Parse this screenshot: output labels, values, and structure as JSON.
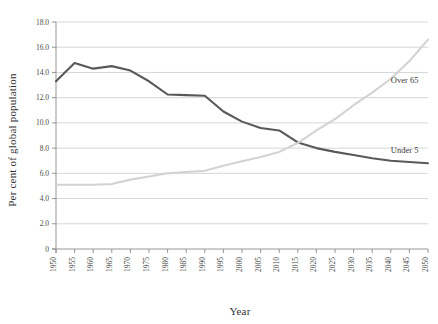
{
  "chart_data": {
    "type": "line",
    "title": "",
    "xlabel": "Year",
    "ylabel": "Per cent of global population",
    "x": [
      1950,
      1955,
      1960,
      1965,
      1970,
      1975,
      1980,
      1985,
      1990,
      1995,
      2000,
      2005,
      2010,
      2015,
      2020,
      2025,
      2030,
      2035,
      2040,
      2045,
      2050
    ],
    "xtick_labels": [
      "1950",
      "1955",
      "1960",
      "1965",
      "1970",
      "1975",
      "1980",
      "1985",
      "1990",
      "1995",
      "2000",
      "2005",
      "2010",
      "2015",
      "2020",
      "2025",
      "2030",
      "2035",
      "2040",
      "2045",
      "2050"
    ],
    "ytick_labels": [
      "0",
      "2.0",
      "4.0",
      "6.0",
      "8.0",
      "10.0",
      "12.0",
      "14.0",
      "16.0",
      "18.0"
    ],
    "ytick_values": [
      0,
      2,
      4,
      6,
      8,
      10,
      12,
      14,
      16,
      18
    ],
    "xlim": [
      1950,
      2050
    ],
    "ylim": [
      0,
      18
    ],
    "grid": "horizontal",
    "legend_position": "inline-right",
    "series": [
      {
        "name": "Under 5",
        "color": "#595959",
        "values": [
          13.3,
          14.75,
          14.3,
          14.5,
          14.15,
          13.3,
          12.25,
          12.2,
          12.15,
          10.9,
          10.1,
          9.6,
          9.4,
          8.45,
          8.0,
          7.7,
          7.45,
          7.2,
          7.0,
          6.9,
          6.8
        ]
      },
      {
        "name": "Over 65",
        "color": "#d3d3d3",
        "values": [
          5.1,
          5.1,
          5.1,
          5.15,
          5.5,
          5.75,
          6.0,
          6.1,
          6.2,
          6.6,
          6.95,
          7.3,
          7.7,
          8.4,
          9.4,
          10.3,
          11.4,
          12.4,
          13.5,
          14.9,
          16.6
        ]
      }
    ],
    "annotations": [
      {
        "text": "Over 65",
        "x": 2040,
        "y": 13.2
      },
      {
        "text": "Under 5",
        "x": 2040,
        "y": 7.65
      }
    ]
  }
}
